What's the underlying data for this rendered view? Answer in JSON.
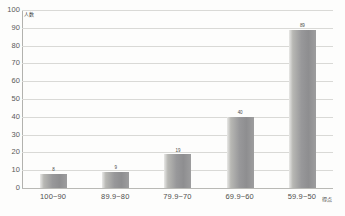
{
  "chart_data": {
    "type": "bar",
    "title": "",
    "subtitle": "",
    "xlabel": "",
    "ylabel": "",
    "categories": [
      "100~90",
      "89.9~80",
      "79.9~70",
      "69.9~60",
      "59.9~50"
    ],
    "values": [
      8,
      9,
      19,
      40,
      89
    ],
    "value_labels": [
      "8",
      "9",
      "19",
      "40",
      "89"
    ],
    "series": [
      {
        "name": "人数",
        "values": [
          8,
          9,
          19,
          40,
          89
        ]
      }
    ],
    "ylim": [
      0,
      100
    ],
    "y_ticks": [
      0,
      10,
      20,
      30,
      40,
      50,
      60,
      70,
      80,
      90,
      100
    ],
    "y_tick_labels": [
      "0",
      "10",
      "20",
      "30",
      "40",
      "50",
      "60",
      "70",
      "80",
      "90",
      "100"
    ],
    "grid": true,
    "grid_axis": "y",
    "legend": false,
    "legend_position": "none",
    "bar_color": "#98989a",
    "bar_gradient": [
      "#e8e8e6",
      "#98989a"
    ],
    "grid_color": "#d9d9d6",
    "axis_color": "#b2b2ae",
    "background": "#fdfdfc"
  },
  "annotations": {
    "top_left_mark": "人数",
    "bottom_right_mark": "得点"
  },
  "y_axis": {
    "ticks": [
      {
        "label": "100",
        "value": 100
      },
      {
        "label": "90",
        "value": 90
      },
      {
        "label": "80",
        "value": 80
      },
      {
        "label": "70",
        "value": 70
      },
      {
        "label": "60",
        "value": 60
      },
      {
        "label": "50",
        "value": 50
      },
      {
        "label": "40",
        "value": 40
      },
      {
        "label": "30",
        "value": 30
      },
      {
        "label": "20",
        "value": 20
      },
      {
        "label": "10",
        "value": 10
      },
      {
        "label": "0",
        "value": 0
      }
    ]
  }
}
